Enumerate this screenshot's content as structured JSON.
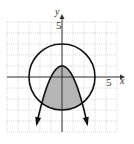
{
  "panel_label": "",
  "chart_data": {
    "type": "line",
    "title": "",
    "xlabel": "x",
    "ylabel": "y",
    "xlim": [
      -5,
      5
    ],
    "ylim": [
      -5,
      5
    ],
    "grid": true,
    "grid_step": 1,
    "tick_labels": {
      "x": "5",
      "y": "5"
    },
    "series": [
      {
        "name": "circle",
        "equation": "x^2 + y^2 = 9",
        "center": [
          0,
          0
        ],
        "radius": 3,
        "style": "solid"
      },
      {
        "name": "parabola",
        "equation": "y = 1 - x^2",
        "vertex": [
          0,
          1
        ],
        "arrows": true,
        "style": "solid"
      }
    ],
    "shaded_region": {
      "description": "inside circle and below parabola",
      "color": "#b5b5b5"
    }
  },
  "colors": {
    "curve": "#111111",
    "axis": "#333333",
    "grid": "#c8c8c8",
    "shade": "#b5b5b5"
  }
}
